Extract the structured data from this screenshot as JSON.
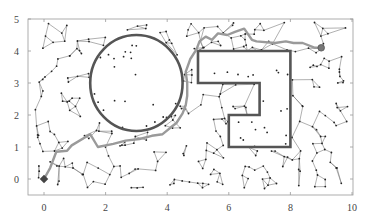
{
  "chart_data": {
    "type": "scatter",
    "title": "",
    "xlabel": "",
    "ylabel": "",
    "xlim": [
      -0.5,
      10
    ],
    "ylim": [
      -0.5,
      5
    ],
    "xticks": [
      0,
      2,
      4,
      6,
      8,
      10
    ],
    "yticks": [
      0,
      1,
      2,
      3,
      4,
      5
    ],
    "grid": false,
    "legend": null,
    "obstacles": [
      {
        "type": "circle",
        "center": [
          3.0,
          3.0
        ],
        "radius": 1.5,
        "color": "#555555"
      },
      {
        "type": "polygon",
        "points": [
          [
            5.0,
            4.0
          ],
          [
            8.0,
            4.0
          ],
          [
            8.0,
            1.0
          ],
          [
            6.0,
            1.0
          ],
          [
            6.0,
            2.0
          ],
          [
            7.0,
            2.0
          ],
          [
            7.0,
            3.0
          ],
          [
            5.0,
            3.0
          ]
        ],
        "color": "#555555"
      }
    ],
    "path": {
      "color": "#999999",
      "points": [
        [
          0,
          0
        ],
        [
          0.2,
          0.35
        ],
        [
          0.4,
          0.85
        ],
        [
          0.75,
          0.88
        ],
        [
          0.9,
          1.05
        ],
        [
          1.5,
          1.4
        ],
        [
          1.75,
          1.0
        ],
        [
          2.25,
          1.1
        ],
        [
          2.65,
          1.2
        ],
        [
          3.1,
          1.25
        ],
        [
          3.5,
          1.35
        ],
        [
          3.85,
          1.4
        ],
        [
          4.1,
          1.6
        ],
        [
          4.3,
          1.75
        ],
        [
          4.5,
          2.05
        ],
        [
          4.6,
          2.3
        ],
        [
          4.65,
          2.6
        ],
        [
          4.65,
          3.0
        ],
        [
          4.6,
          3.35
        ],
        [
          4.75,
          3.75
        ],
        [
          4.95,
          4.05
        ],
        [
          5.05,
          4.3
        ],
        [
          5.25,
          4.45
        ],
        [
          5.45,
          4.35
        ],
        [
          5.65,
          4.55
        ],
        [
          5.95,
          4.5
        ],
        [
          6.2,
          4.6
        ],
        [
          6.5,
          4.7
        ],
        [
          6.75,
          4.35
        ],
        [
          6.9,
          4.3
        ],
        [
          7.5,
          4.25
        ],
        [
          7.85,
          4.3
        ],
        [
          8.1,
          4.25
        ],
        [
          8.4,
          4.25
        ],
        [
          8.8,
          4.1
        ],
        [
          9.0,
          4.1
        ]
      ]
    },
    "start": [
      0,
      0
    ],
    "goal": [
      9.0,
      4.1
    ],
    "samples_count_approx": 300
  }
}
